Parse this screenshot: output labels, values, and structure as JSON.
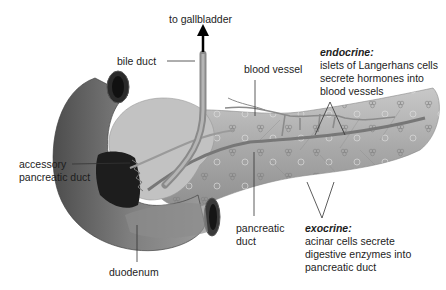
{
  "diagram": {
    "labels": {
      "to_gallbladder": "to gallbladder",
      "bile_duct": "bile duct",
      "blood_vessel": "blood vessel",
      "endocrine_title": "endocrine:",
      "endocrine_lines": [
        "islets of Langerhans cells",
        "secrete hormones into",
        "blood vessels"
      ],
      "accessory_duct_lines": [
        "accessory",
        "pancreatic duct"
      ],
      "pancreatic_duct_lines": [
        "pancreatic",
        "duct"
      ],
      "exocrine_title": "exocrine:",
      "exocrine_lines": [
        "acinar cells secrete",
        "digestive enzymes into",
        "pancreatic duct"
      ],
      "duodenum": "duodenum"
    },
    "colors": {
      "background": "#ffffff",
      "duodenum": "#6f6f6f",
      "pancreas": "#a8a8a8",
      "duct": "#7a7a7a",
      "leader_line": "#333333",
      "text": "#1d1d1d"
    }
  }
}
